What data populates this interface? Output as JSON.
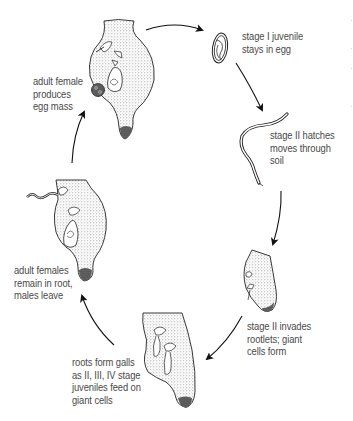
{
  "diagram": {
    "type": "cycle",
    "direction": "clockwise",
    "colors": {
      "background": "#ffffff",
      "text": "#4a4a4a",
      "ink": "#1a1a1a",
      "stipple": "#9a9a9a"
    },
    "stages": [
      {
        "id": "egg",
        "label": "stage I juvenile\nstays in egg",
        "illustration": "egg-with-coiled-juvenile-icon"
      },
      {
        "id": "hatch",
        "label": "stage II hatches\nmoves through\nsoil",
        "illustration": "worm-juvenile-icon"
      },
      {
        "id": "invade",
        "label": "stage II invades\nrootlets; giant\ncells form",
        "illustration": "rootlet-tip-icon"
      },
      {
        "id": "galls",
        "label": "roots form galls\nas II, III, IV stage\njuveniles feed on\ngiant cells",
        "illustration": "root-gall-icon"
      },
      {
        "id": "adult-root",
        "label": "adult females\nremain in root,\nmales leave",
        "illustration": "swollen-root-with-female-icon"
      },
      {
        "id": "egg-mass",
        "label": "adult female\nproduces\negg mass",
        "illustration": "root-gall-with-egg-mass-icon"
      }
    ],
    "arrows": [
      {
        "from": "egg-mass",
        "to": "egg"
      },
      {
        "from": "egg",
        "to": "hatch"
      },
      {
        "from": "hatch",
        "to": "invade"
      },
      {
        "from": "invade",
        "to": "galls"
      },
      {
        "from": "galls",
        "to": "adult-root"
      },
      {
        "from": "adult-root",
        "to": "egg-mass"
      }
    ]
  }
}
